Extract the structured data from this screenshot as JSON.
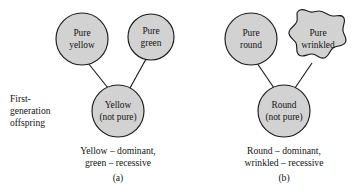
{
  "figure": {
    "colors": {
      "shape_fill": "#d2d2d2",
      "shape_stroke": "#1b1b1b",
      "text": "#141414",
      "background": "#ffffff"
    },
    "side_label": {
      "line1": "First-",
      "line2": "generation",
      "line3": "offspring"
    },
    "panels": [
      {
        "letter": "(a)",
        "parents": [
          {
            "line1": "Pure",
            "line2": "yellow",
            "shape": "circle"
          },
          {
            "line1": "Pure",
            "line2": "green",
            "shape": "circle"
          }
        ],
        "offspring": {
          "line1": "Yellow",
          "line2": "(not pure)",
          "shape": "circle"
        },
        "caption_line1": "Yellow – dominant,",
        "caption_line2": "green – recessive"
      },
      {
        "letter": "(b)",
        "parents": [
          {
            "line1": "Pure",
            "line2": "round",
            "shape": "circle"
          },
          {
            "line1": "Pure",
            "line2": "wrinkled",
            "shape": "wrinkled-blob"
          }
        ],
        "offspring": {
          "line1": "Round",
          "line2": "(not pure)",
          "shape": "circle"
        },
        "caption_line1": "Round – dominant,",
        "caption_line2": "wrinkled – recessive"
      }
    ]
  }
}
